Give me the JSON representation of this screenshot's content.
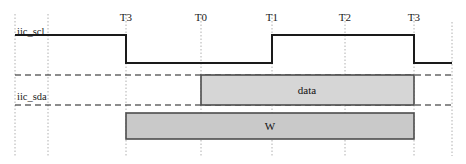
{
  "diagram": {
    "type": "timing-diagram",
    "title": "",
    "width": 466,
    "height": 164,
    "background": "#ffffff",
    "colors": {
      "waveform": "#1a1a1a",
      "guide": "#9a9a9a",
      "dashed_reference": "#1a1a1a",
      "block_fill": "#cccccc",
      "block_fill_light": "#d8d8d8",
      "block_stroke": "#4d4d4d",
      "text": "#1a1a1a"
    },
    "time_markers": [
      {
        "label": "T3",
        "x": 126
      },
      {
        "label": "T0",
        "x": 201
      },
      {
        "label": "T1",
        "x": 272
      },
      {
        "label": "T2",
        "x": 345
      },
      {
        "label": "T3",
        "x": 414
      }
    ],
    "signals": [
      {
        "name": "iic_scl",
        "label": "iic_scl",
        "label_x": 16,
        "label_y": 33,
        "high_y": 35,
        "low_y": 63,
        "transitions": [
          {
            "x": 126,
            "edge": "falling"
          },
          {
            "x": 272,
            "edge": "rising"
          },
          {
            "x": 414,
            "edge": "falling"
          }
        ],
        "start_x": 15,
        "end_x": 452,
        "initial_level": "high"
      },
      {
        "name": "iic_sda",
        "label": "iic_sda",
        "label_x": 16,
        "label_y": 98,
        "high_y": 75,
        "low_y": 105,
        "start_x": 15,
        "end_x": 452
      }
    ],
    "blocks": [
      {
        "name": "data",
        "label": "data",
        "x": 201,
        "y": 75,
        "width": 213,
        "height": 30,
        "row": "iic_sda"
      },
      {
        "name": "W",
        "label": "W",
        "x": 126,
        "y": 113,
        "width": 288,
        "height": 26,
        "row": "write-phase"
      }
    ],
    "vertical_guides": [
      15,
      48,
      126,
      201,
      272,
      345,
      414,
      452
    ],
    "dashed_reference_lines": [
      {
        "y": 75,
        "x1": 15,
        "x2": 452
      },
      {
        "y": 105,
        "x1": 15,
        "x2": 452
      }
    ]
  }
}
